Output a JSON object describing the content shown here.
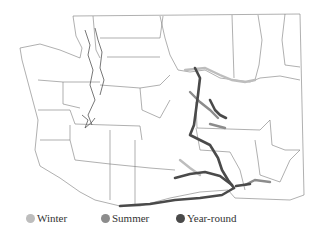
{
  "map": {
    "region": "Washington State",
    "subject": "County boundaries with seasonal waterway routes"
  },
  "legend": {
    "items": [
      {
        "label": "Winter",
        "color": "#bdbdbd"
      },
      {
        "label": "Summer",
        "color": "#8c8c8c"
      },
      {
        "label": "Year-round",
        "color": "#4a4a4a"
      }
    ]
  },
  "colors": {
    "county_border": "#7a7a7a",
    "background": "#ffffff",
    "winter": "#bdbdbd",
    "summer": "#8c8c8c",
    "year_round": "#4a4a4a"
  }
}
